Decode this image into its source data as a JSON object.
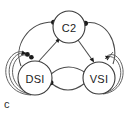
{
  "figure": {
    "panel_letter": "c",
    "background_color": "#ffffff",
    "line_color": "#4a4a4a",
    "node_fill": "#ffffff",
    "node_stroke": "#3a3a3a",
    "terminal_color": "#1b1b1b"
  },
  "diagram": {
    "type": "neural-circuit-graph",
    "nodes": [
      {
        "id": "c2",
        "label": "C2",
        "cx": 69,
        "cy": 27,
        "r": 16
      },
      {
        "id": "dsi",
        "label": "DSI",
        "cx": 35,
        "cy": 78,
        "r": 17
      },
      {
        "id": "vsi",
        "label": "VSI",
        "cx": 99,
        "cy": 78,
        "r": 16
      }
    ],
    "edges": [
      {
        "from": "dsi",
        "to": "c2",
        "terminal": "dot",
        "style": "arc-left-outer"
      },
      {
        "from": "dsi",
        "to": "c2",
        "terminal": "arrow",
        "style": "straight-inner"
      },
      {
        "from": "c2",
        "to": "vsi",
        "terminal": "dot",
        "style": "arc-right-outer"
      },
      {
        "from": "c2",
        "to": "vsi",
        "terminal": "arrow",
        "style": "straight-inner"
      },
      {
        "from": "dsi",
        "to": "vsi",
        "terminal": "dot",
        "style": "lens-upper"
      },
      {
        "from": "vsi",
        "to": "dsi",
        "terminal": "dot",
        "style": "lens-lower"
      },
      {
        "from": "dsi",
        "to": "dsi",
        "terminal": "dot",
        "style": "self-loop-left-1"
      },
      {
        "from": "dsi",
        "to": "dsi",
        "terminal": "dot",
        "style": "self-loop-left-2"
      },
      {
        "from": "dsi",
        "to": "dsi",
        "terminal": "arrow",
        "style": "self-loop-left-3"
      },
      {
        "from": "vsi",
        "to": "vsi",
        "terminal": "arrow",
        "style": "self-loop-right-1"
      },
      {
        "from": "vsi",
        "to": "vsi",
        "terminal": "arrow",
        "style": "self-loop-right-2"
      }
    ]
  }
}
